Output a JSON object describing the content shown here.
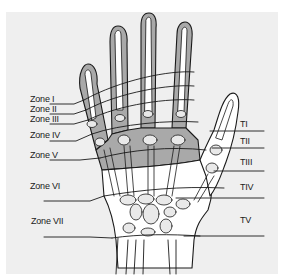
{
  "figure": {
    "colors": {
      "background": "#efefef",
      "margin": "#ffffff",
      "shaded_zone": "#a9a9a9",
      "bone": "#e9e9e9",
      "outline": "#1a1a1a"
    }
  },
  "finger_zones": [
    {
      "label": "Zone I"
    },
    {
      "label": "Zone II"
    },
    {
      "label": "Zone III"
    },
    {
      "label": "Zone IV"
    },
    {
      "label": "Zone V"
    },
    {
      "label": "Zone VI"
    },
    {
      "label": "Zone VII"
    }
  ],
  "thumb_zones": [
    {
      "label": "TI"
    },
    {
      "label": "TII"
    },
    {
      "label": "TIII"
    },
    {
      "label": "TIV"
    },
    {
      "label": "TV"
    }
  ]
}
